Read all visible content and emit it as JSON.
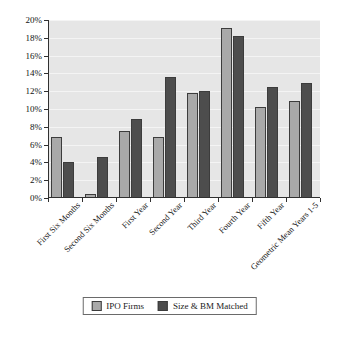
{
  "chart_data": {
    "type": "bar",
    "title": "",
    "subtitle": "",
    "xlabel": "",
    "ylabel": "",
    "ylim": [
      0,
      20
    ],
    "ytick_labels": [
      "0%",
      "2%",
      "4%",
      "6%",
      "8%",
      "10%",
      "12%",
      "14%",
      "16%",
      "18%",
      "20%"
    ],
    "ytick_values": [
      0,
      2,
      4,
      6,
      8,
      10,
      12,
      14,
      16,
      18,
      20
    ],
    "grid": true,
    "legend_position": "bottom",
    "categories": [
      "First Six Months",
      "Second Six Months",
      "First Year",
      "Second Year",
      "Third Year",
      "Fourth Year",
      "Fifth Year",
      "Geometric Mean Years 1-5"
    ],
    "series": [
      {
        "name": "IPO Firms",
        "color": "#a9a9a9",
        "values": [
          6.8,
          0.5,
          7.5,
          6.8,
          11.8,
          19.1,
          10.2,
          10.9
        ]
      },
      {
        "name": "Size & BM Matched",
        "color": "#4d4d4d",
        "values": [
          4.0,
          4.6,
          8.9,
          13.6,
          12.0,
          18.2,
          12.5,
          12.9
        ]
      }
    ]
  },
  "legend": {
    "items": [
      {
        "label": "IPO Firms"
      },
      {
        "label": "Size & BM Matched"
      }
    ]
  },
  "colors": {
    "series_ipo": "#a9a9a9",
    "series_matched": "#4d4d4d",
    "plot_background": "#e6e6e6",
    "gridline": "#f4f4f4",
    "axis": "#303030"
  }
}
